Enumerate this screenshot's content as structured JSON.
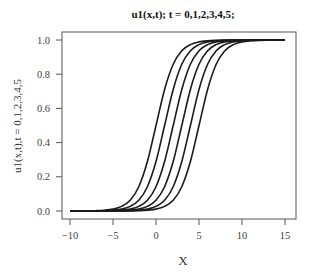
{
  "chart_data": {
    "type": "line",
    "title": "u1(x,t); t = 0,1,2,3,4,5;",
    "xlabel": "X",
    "ylabel": "u1(x,t),t = 0,1,2,3,4,5",
    "xlim": [
      -10.7,
      16.3
    ],
    "ylim": [
      -0.05,
      1.05
    ],
    "xticks": [
      -10,
      -5,
      0,
      5,
      10,
      15
    ],
    "xtick_labels": [
      "−10",
      "−5",
      "0",
      "5",
      "10",
      "15"
    ],
    "yticks": [
      0.0,
      0.2,
      0.4,
      0.6,
      0.8,
      1.0
    ],
    "ytick_labels": [
      "0.0",
      "0.2",
      "0.4",
      "0.6",
      "0.8",
      "1.0"
    ],
    "grid": false,
    "legend": "none",
    "line_color": "#1a1a1a",
    "x": [
      -10,
      -9,
      -8,
      -7,
      -6,
      -5,
      -4,
      -3,
      -2,
      -1,
      0,
      1,
      2,
      3,
      4,
      5,
      6,
      7,
      8,
      9,
      10,
      11,
      12,
      13,
      14,
      15
    ],
    "series": [
      {
        "name": "t=0",
        "values": [
          0.0001,
          0.0003,
          0.0007,
          0.0018,
          0.0045,
          0.011,
          0.027,
          0.063,
          0.142,
          0.289,
          0.5,
          0.711,
          0.858,
          0.937,
          0.973,
          0.989,
          0.9955,
          0.998,
          0.999,
          0.999,
          0.999,
          0.999,
          0.999,
          0.999,
          0.999,
          0.999
        ]
      },
      {
        "name": "t=1",
        "values": [
          0.0001,
          0.0001,
          0.0003,
          0.0007,
          0.0018,
          0.0045,
          0.011,
          0.027,
          0.063,
          0.142,
          0.289,
          0.5,
          0.711,
          0.858,
          0.937,
          0.973,
          0.989,
          0.9955,
          0.998,
          0.999,
          0.999,
          0.999,
          0.999,
          0.999,
          0.999,
          0.999
        ]
      },
      {
        "name": "t=2",
        "values": [
          0.0001,
          0.0001,
          0.0001,
          0.0003,
          0.0007,
          0.0018,
          0.0045,
          0.011,
          0.027,
          0.063,
          0.142,
          0.289,
          0.5,
          0.711,
          0.858,
          0.937,
          0.973,
          0.989,
          0.9955,
          0.998,
          0.999,
          0.999,
          0.999,
          0.999,
          0.999,
          0.999
        ]
      },
      {
        "name": "t=3",
        "values": [
          0.0001,
          0.0001,
          0.0001,
          0.0001,
          0.0003,
          0.0007,
          0.0018,
          0.0045,
          0.011,
          0.027,
          0.063,
          0.142,
          0.289,
          0.5,
          0.711,
          0.858,
          0.937,
          0.973,
          0.989,
          0.9955,
          0.998,
          0.999,
          0.999,
          0.999,
          0.999,
          0.999
        ]
      },
      {
        "name": "t=4",
        "values": [
          0.0001,
          0.0001,
          0.0001,
          0.0001,
          0.0001,
          0.0003,
          0.0007,
          0.0018,
          0.0045,
          0.011,
          0.027,
          0.063,
          0.142,
          0.289,
          0.5,
          0.711,
          0.858,
          0.937,
          0.973,
          0.989,
          0.9955,
          0.998,
          0.999,
          0.999,
          0.999,
          0.999
        ]
      },
      {
        "name": "t=5",
        "values": [
          0.0001,
          0.0001,
          0.0001,
          0.0001,
          0.0001,
          0.0001,
          0.0003,
          0.0007,
          0.0018,
          0.0045,
          0.011,
          0.027,
          0.063,
          0.142,
          0.289,
          0.5,
          0.711,
          0.858,
          0.937,
          0.973,
          0.989,
          0.9955,
          0.998,
          0.999,
          0.999,
          0.999
        ]
      }
    ]
  }
}
